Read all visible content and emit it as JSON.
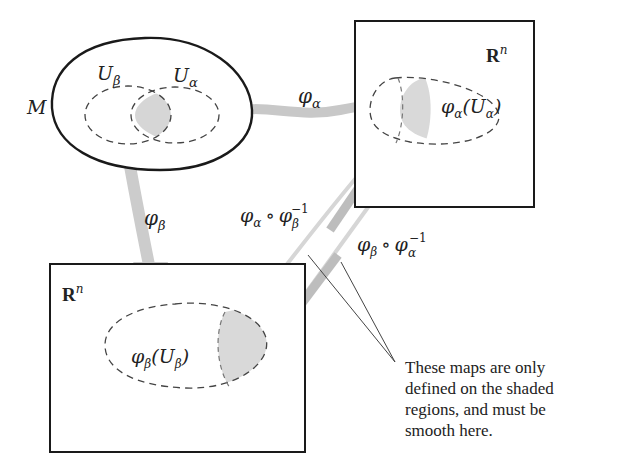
{
  "diagram": {
    "type": "manifold-chart-transition",
    "manifold": {
      "label": "M"
    },
    "open_sets": [
      {
        "id": "U_beta",
        "label": "U",
        "subscript": "β"
      },
      {
        "id": "U_alpha",
        "label": "U",
        "subscript": "α"
      }
    ],
    "spaces": [
      {
        "id": "Rn_right",
        "label": "R",
        "superscript": "n"
      },
      {
        "id": "Rn_left",
        "label": "R",
        "superscript": "n"
      }
    ],
    "images": [
      {
        "id": "phi_alpha_U_alpha",
        "phi": "φ",
        "phi_sub": "α",
        "open": "(U",
        "u_sub": "α",
        "close": ")"
      },
      {
        "id": "phi_beta_U_beta",
        "phi": "φ",
        "phi_sub": "β",
        "open": "(U",
        "u_sub": "β",
        "close": ")"
      }
    ],
    "maps": [
      {
        "id": "phi_alpha",
        "symbol": "φ",
        "sub": "α"
      },
      {
        "id": "phi_beta",
        "symbol": "φ",
        "sub": "β"
      },
      {
        "id": "transition_ab",
        "symbol": "φ",
        "sub": "α",
        "compose": "∘",
        "symbol2": "φ",
        "sub2": "β",
        "sup2": "−1"
      },
      {
        "id": "transition_ba",
        "symbol": "φ",
        "sub": "β",
        "compose": "∘",
        "symbol2": "φ",
        "sub2": "α",
        "sup2": "−1"
      }
    ],
    "annotation": {
      "lines": [
        "These maps are only",
        "defined on the shaded",
        "regions, and must be",
        "smooth here."
      ]
    },
    "colors": {
      "outline": "#1a1a1a",
      "dashed": "#444444",
      "shade": "#d9d9d9",
      "arrow": "#c8c8c8"
    }
  }
}
